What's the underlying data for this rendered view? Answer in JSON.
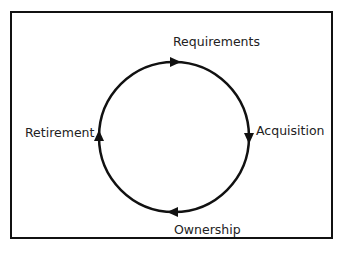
{
  "diagram": {
    "type": "lifecycle-cycle",
    "direction": "clockwise",
    "stages": [
      {
        "name": "Requirements",
        "position": "top"
      },
      {
        "name": "Acquisition",
        "position": "right"
      },
      {
        "name": "Ownership",
        "position": "bottom"
      },
      {
        "name": "Retirement",
        "position": "left"
      }
    ],
    "colors": {
      "stroke": "#111111",
      "text": "#222222",
      "background": "#ffffff"
    }
  }
}
